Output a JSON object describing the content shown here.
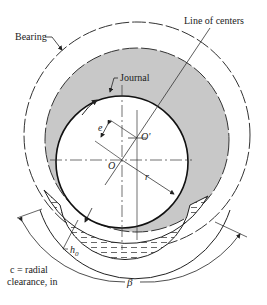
{
  "diagram": {
    "labels": {
      "bearing": "Bearing",
      "line_of_centers": "Line of centers",
      "journal": "Journal",
      "eccentricity": "e",
      "bearing_center": "O'",
      "journal_center": "O",
      "radius": "r",
      "min_film": "h",
      "min_film_sub": "0",
      "clearance_line1": "c = radial",
      "clearance_line2": "clearance, in",
      "angle": "β"
    },
    "colors": {
      "film": "#c8c8c8",
      "stroke": "#222222",
      "background": "#ffffff"
    }
  }
}
